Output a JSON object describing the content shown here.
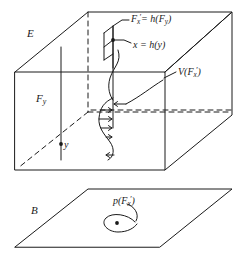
{
  "figure": {
    "background_color": "#ffffff",
    "stroke_color": "#1a1a1a",
    "labels": {
      "total_space": "E",
      "base_space": "B",
      "fiber": "F",
      "fiber_sub": "y",
      "point": "y",
      "map_sets": "F",
      "map_sets_sub": "x",
      "map_sets_prime": "′",
      "map_sets_rhs": "= h(F",
      "map_sets_rhs_sub": "y",
      "map_sets_rhs_end": ")",
      "map_points": "x = h(y)",
      "vector_field": "V(F",
      "vector_field_sub": "x",
      "vector_field_prime": "′",
      "vector_field_end": ")",
      "projection": "p(F",
      "projection_sub": "x",
      "projection_prime": "′",
      "projection_end": ")"
    },
    "label_text": {
      "total_space": "E",
      "base_space": "B",
      "fiber_label": "Fy",
      "point_label": "y",
      "top_equation_1": "F′x = h(Fy)",
      "top_equation_2": "x = h(y)",
      "vector_field_label": "V(F′x)",
      "projection_label": "p(F′x)"
    },
    "elements": {
      "box": "solid-box-E",
      "plane": "parallelogram-B",
      "fiber_line": "vertical-fiber-line",
      "hidden_edges": "dashed-lines",
      "flow_curve": "s-shaped-vector-field-curve",
      "arrows": "four-right-pointing-arrows",
      "blob": "teardrop-region-with-dot",
      "strip": "upper-parallelogram-strip"
    }
  }
}
